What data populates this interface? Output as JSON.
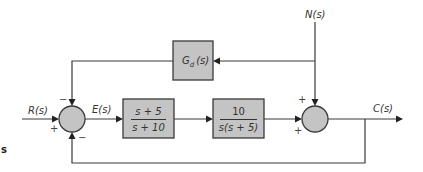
{
  "diagram": {
    "type": "control-system-block-diagram",
    "signals": {
      "input": "R(s)",
      "error": "E(s)",
      "disturbance": "N(s)",
      "output": "C(s)"
    },
    "blocks": {
      "controller": {
        "numerator": "s + 5",
        "denominator": "s + 10"
      },
      "plant": {
        "numerator": "10",
        "denominator": "s(s + 5)"
      },
      "disturbance_feedforward": {
        "label_main": "G",
        "label_sub": "d",
        "label_arg": "(s)"
      }
    },
    "summing_junction_1": {
      "signs": {
        "left": "+",
        "top": "−",
        "bottom": "−"
      }
    },
    "summing_junction_2": {
      "signs": {
        "top": "+",
        "left": "+"
      }
    },
    "edge_fragment": "s",
    "colors": {
      "block_fill": "#c4c4c4",
      "line": "#3a3a3a",
      "background": "#ffffff"
    }
  }
}
